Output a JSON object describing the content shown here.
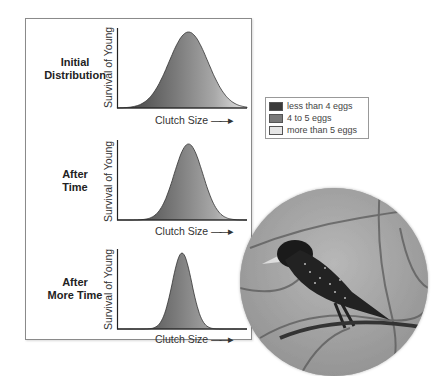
{
  "chart_data": [
    {
      "type": "area",
      "title": "Initial Distribution",
      "xlabel": "Clutch Size",
      "ylabel": "Survival of Young",
      "distribution": {
        "shape": "normal",
        "relative_mean": 0.55,
        "relative_width": "wide"
      }
    },
    {
      "type": "area",
      "title": "After Time",
      "xlabel": "Clutch Size",
      "ylabel": "Survival of Young",
      "distribution": {
        "shape": "normal",
        "relative_mean": 0.55,
        "relative_width": "medium"
      }
    },
    {
      "type": "area",
      "title": "After More Time",
      "xlabel": "Clutch Size",
      "ylabel": "Survival of Young",
      "distribution": {
        "shape": "normal",
        "relative_mean": 0.5,
        "relative_width": "narrow"
      }
    }
  ],
  "panels": [
    {
      "label_line1": "Initial",
      "label_line2": "Distribution",
      "ylabel": "Survival of Young",
      "xlabel": "Clutch Size",
      "sigma": 0.15,
      "mean": 0.55
    },
    {
      "label_line1": "After",
      "label_line2": "Time",
      "ylabel": "Survival of Young",
      "xlabel": "Clutch Size",
      "sigma": 0.11,
      "mean": 0.55
    },
    {
      "label_line1": "After",
      "label_line2": "More Time",
      "ylabel": "Survival of Young",
      "xlabel": "Clutch Size",
      "sigma": 0.075,
      "mean": 0.5
    }
  ],
  "legend": {
    "items": [
      {
        "label": "less than 4 eggs",
        "color": "#3a3a3a"
      },
      {
        "label": "4 to 5 eggs",
        "color": "#7a7a7a"
      },
      {
        "label": "more than 5 eggs",
        "color": "#e6e6e6"
      }
    ]
  },
  "arrow_glyph": "→",
  "photo": {
    "subject": "starling perched on branch"
  }
}
